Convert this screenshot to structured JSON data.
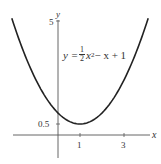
{
  "chart_data": {
    "type": "line",
    "title": "",
    "function": "y = 1/2 x^2 - x + 1",
    "series": [
      {
        "name": "y = 1/2 x^2 - x + 1",
        "x": [
          -2.1,
          -2,
          -1.5,
          -1,
          -0.5,
          0,
          0.5,
          1,
          1.5,
          2,
          2.5,
          3,
          3.5,
          4,
          4.1
        ],
        "y": [
          5.305,
          5,
          3.625,
          2.5,
          1.625,
          1,
          0.625,
          0.5,
          0.625,
          1,
          1.625,
          2.5,
          3.625,
          5,
          5.305
        ]
      }
    ],
    "xlabel": "x",
    "ylabel": "y",
    "xticks": [
      1,
      3
    ],
    "yticks": [
      0.5,
      5
    ],
    "xlim": [
      -2.1,
      4.1
    ],
    "ylim": [
      -1.3,
      5.4
    ],
    "grid": false,
    "annotations": [
      {
        "text": "y = 1/2 x^2 - x + 1",
        "x": 0.3,
        "y": 3.8
      }
    ],
    "color": "#333333"
  },
  "labels": {
    "x_axis": "x",
    "y_axis": "y",
    "xtick_1": "1",
    "xtick_3": "3",
    "ytick_05": "0.5",
    "ytick_5": "5",
    "eq_lhs": "y =",
    "eq_num": "1",
    "eq_den": "2",
    "eq_x": "x",
    "eq_exp": "2",
    "eq_rest": " − x + 1"
  }
}
